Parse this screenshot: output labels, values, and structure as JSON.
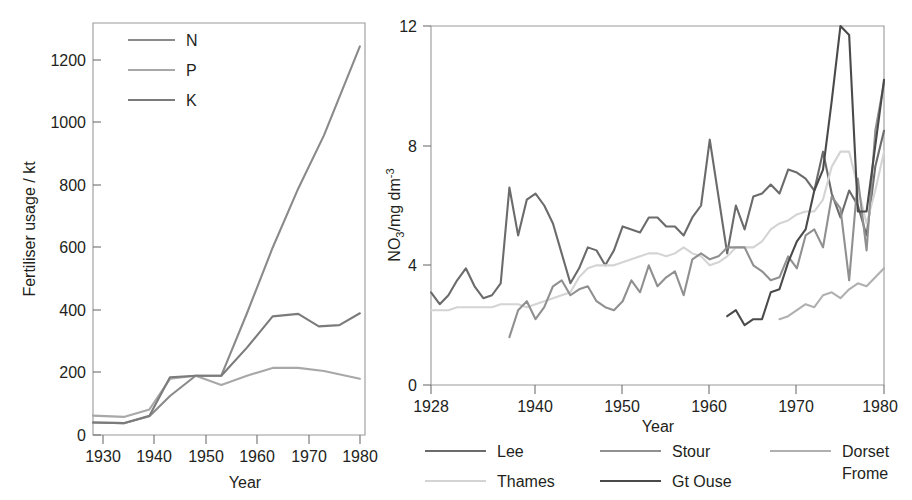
{
  "chart_data": [
    {
      "id": "fertiliser",
      "type": "line",
      "title": "",
      "xlabel": "Year",
      "ylabel": "Fertiliser usage / kt",
      "xlim": [
        1928,
        1981
      ],
      "ylim": [
        0,
        1320
      ],
      "xticks": [
        1930,
        1940,
        1950,
        1960,
        1970,
        1980
      ],
      "xticklabels": [
        "1930",
        "1940",
        "1950",
        "1960",
        "1970",
        "1980"
      ],
      "yticks": [
        0,
        200,
        400,
        600,
        800,
        1000,
        1200
      ],
      "yticklabels": [
        "0",
        "200",
        "400",
        "600",
        "800",
        "1000",
        "1200"
      ],
      "grid": false,
      "legend_position": "upper-left-inside",
      "legend_entries": [
        "N",
        "P",
        "K"
      ],
      "series": [
        {
          "name": "N",
          "color": "#8a8a8a",
          "x": [
            1928,
            1934,
            1939,
            1943,
            1948,
            1953,
            1958,
            1963,
            1968,
            1973,
            1980
          ],
          "values": [
            40,
            38,
            60,
            125,
            190,
            190,
            390,
            600,
            790,
            960,
            1245
          ]
        },
        {
          "name": "P",
          "color": "#a8a8a8",
          "x": [
            1928,
            1934,
            1939,
            1943,
            1948,
            1953,
            1958,
            1963,
            1968,
            1973,
            1980
          ],
          "values": [
            62,
            58,
            82,
            180,
            190,
            160,
            190,
            215,
            215,
            205,
            180
          ]
        },
        {
          "name": "K",
          "color": "#7b7b7b",
          "x": [
            1928,
            1934,
            1939,
            1943,
            1948,
            1953,
            1958,
            1963,
            1968,
            1972,
            1976,
            1980
          ],
          "values": [
            40,
            38,
            62,
            185,
            190,
            190,
            280,
            380,
            388,
            348,
            352,
            390
          ]
        }
      ]
    },
    {
      "id": "nitrate",
      "type": "line",
      "title": "",
      "xlabel": "Year",
      "ylabel": "NO3/mg dm-3",
      "ylabel_parts": {
        "base": "NO",
        "sub": "3",
        "mid": "/mg dm",
        "sup": "-3"
      },
      "xlim": [
        1928,
        1980
      ],
      "ylim": [
        0,
        12
      ],
      "xticks": [
        1928,
        1940,
        1950,
        1960,
        1970,
        1980
      ],
      "xticklabels": [
        "1928",
        "1940",
        "1950",
        "1960",
        "1970",
        "1980"
      ],
      "yticks": [
        0,
        4,
        8,
        12
      ],
      "yticklabels": [
        "0",
        "4",
        "8",
        "12"
      ],
      "grid": false,
      "legend_position": "below",
      "legend_entries": [
        "Lee",
        "Thames",
        "Stour",
        "Gt Ouse",
        "Dorset Frome"
      ],
      "series": [
        {
          "name": "Lee",
          "color": "#6b6b6b",
          "x": [
            1928,
            1929,
            1930,
            1931,
            1932,
            1933,
            1934,
            1935,
            1936,
            1937,
            1938,
            1939,
            1940,
            1941,
            1942,
            1943,
            1944,
            1945,
            1946,
            1947,
            1948,
            1949,
            1950,
            1951,
            1952,
            1953,
            1954,
            1955,
            1956,
            1957,
            1958,
            1959,
            1960,
            1961,
            1962,
            1963,
            1964,
            1965,
            1966,
            1967,
            1968,
            1969,
            1970,
            1971,
            1972,
            1973,
            1974,
            1975,
            1976,
            1977,
            1978,
            1979,
            1980
          ],
          "values": [
            3.1,
            2.7,
            3.0,
            3.5,
            3.9,
            3.3,
            2.9,
            3.0,
            3.4,
            6.6,
            5.0,
            6.2,
            6.4,
            6.0,
            5.4,
            4.4,
            3.4,
            3.9,
            4.6,
            4.5,
            4.0,
            4.5,
            5.3,
            5.2,
            5.1,
            5.6,
            5.6,
            5.3,
            5.3,
            5.0,
            5.6,
            6.0,
            8.2,
            6.3,
            4.4,
            6.0,
            5.2,
            6.3,
            6.4,
            6.7,
            6.4,
            7.2,
            7.1,
            6.9,
            6.5,
            7.8,
            6.4,
            5.6,
            6.5,
            6.0,
            5.0,
            7.3,
            8.5
          ]
        },
        {
          "name": "Thames",
          "color": "#d4d4d4",
          "x": [
            1928,
            1929,
            1930,
            1931,
            1932,
            1933,
            1934,
            1935,
            1936,
            1937,
            1938,
            1939,
            1940,
            1941,
            1942,
            1943,
            1944,
            1945,
            1946,
            1947,
            1948,
            1949,
            1950,
            1951,
            1952,
            1953,
            1954,
            1955,
            1956,
            1957,
            1958,
            1959,
            1960,
            1961,
            1962,
            1963,
            1964,
            1965,
            1966,
            1967,
            1968,
            1969,
            1970,
            1971,
            1972,
            1973,
            1974,
            1975,
            1976,
            1977,
            1978,
            1979,
            1980
          ],
          "values": [
            2.5,
            2.5,
            2.5,
            2.6,
            2.6,
            2.6,
            2.6,
            2.6,
            2.7,
            2.7,
            2.7,
            2.6,
            2.7,
            2.8,
            2.9,
            3.0,
            3.1,
            3.6,
            3.9,
            4.0,
            4.0,
            4.0,
            4.1,
            4.2,
            4.3,
            4.4,
            4.4,
            4.3,
            4.4,
            4.6,
            4.4,
            4.3,
            4.0,
            4.1,
            4.3,
            4.6,
            4.6,
            4.6,
            4.8,
            5.2,
            5.4,
            5.5,
            5.7,
            5.8,
            5.8,
            6.2,
            7.3,
            7.8,
            7.8,
            6.6,
            5.4,
            6.5,
            7.8
          ]
        },
        {
          "name": "Stour",
          "color": "#909090",
          "x": [
            1937,
            1938,
            1939,
            1940,
            1941,
            1942,
            1943,
            1944,
            1945,
            1946,
            1947,
            1948,
            1949,
            1950,
            1951,
            1952,
            1953,
            1954,
            1955,
            1956,
            1957,
            1958,
            1959,
            1960,
            1961,
            1962,
            1963,
            1964,
            1965,
            1966,
            1967,
            1968,
            1969,
            1970,
            1971,
            1972,
            1973,
            1974,
            1975,
            1976,
            1977,
            1978,
            1979,
            1980
          ],
          "values": [
            1.6,
            2.5,
            2.8,
            2.2,
            2.6,
            3.3,
            3.5,
            3.0,
            3.2,
            3.3,
            2.8,
            2.6,
            2.5,
            2.8,
            3.5,
            3.1,
            4.0,
            3.3,
            3.6,
            3.8,
            3.0,
            4.2,
            4.4,
            4.2,
            4.3,
            4.6,
            4.6,
            4.6,
            4.0,
            3.8,
            3.5,
            3.6,
            4.3,
            3.9,
            5.0,
            5.2,
            4.6,
            6.3,
            5.9,
            3.5,
            6.9,
            4.5,
            8.5,
            10.1
          ]
        },
        {
          "name": "Gt Ouse",
          "color": "#4a4a4a",
          "x": [
            1962,
            1963,
            1964,
            1965,
            1966,
            1967,
            1968,
            1969,
            1970,
            1971,
            1972,
            1973,
            1974,
            1975,
            1976,
            1977,
            1978,
            1979,
            1980
          ],
          "values": [
            2.3,
            2.5,
            2.0,
            2.2,
            2.2,
            3.1,
            3.2,
            4.1,
            4.8,
            5.2,
            6.5,
            7.2,
            9.5,
            12.0,
            11.7,
            5.8,
            5.8,
            8.0,
            10.2
          ]
        },
        {
          "name": "Dorset Frome",
          "color": "#b0b0b0",
          "x": [
            1968,
            1969,
            1970,
            1971,
            1972,
            1973,
            1974,
            1975,
            1976,
            1977,
            1978,
            1979,
            1980
          ],
          "values": [
            2.2,
            2.3,
            2.5,
            2.7,
            2.6,
            3.0,
            3.1,
            2.9,
            3.2,
            3.4,
            3.3,
            3.6,
            3.9
          ]
        }
      ]
    }
  ],
  "left_chart": {
    "ylabel": "Fertiliser usage / kt",
    "xlabel": "Year",
    "legend": [
      {
        "label": "N",
        "color": "#8a8a8a"
      },
      {
        "label": "P",
        "color": "#a8a8a8"
      },
      {
        "label": "K",
        "color": "#7b7b7b"
      }
    ],
    "xticklabels": [
      "1930",
      "1940",
      "1950",
      "1960",
      "1970",
      "1980"
    ],
    "yticklabels": [
      "0",
      "200",
      "400",
      "600",
      "800",
      "1000",
      "1200"
    ]
  },
  "right_chart": {
    "ylabel_base": "NO",
    "ylabel_sub": "3",
    "ylabel_mid": "/mg dm",
    "ylabel_sup": "-3",
    "xlabel": "Year",
    "xticklabels": [
      "1928",
      "1940",
      "1950",
      "1960",
      "1970",
      "1980"
    ],
    "yticklabels": [
      "0",
      "4",
      "8",
      "12"
    ],
    "legend": [
      {
        "label": "Lee",
        "color": "#6b6b6b"
      },
      {
        "label": "Thames",
        "color": "#d4d4d4"
      },
      {
        "label": "Stour",
        "color": "#909090"
      },
      {
        "label": "Gt Ouse",
        "color": "#4a4a4a"
      },
      {
        "label": "Dorset",
        "label2": "Frome",
        "color": "#b0b0b0"
      }
    ]
  }
}
